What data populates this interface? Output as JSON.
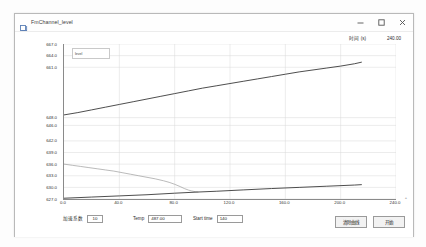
{
  "window": {
    "title": "FmChannel_level",
    "icon": "app-icon",
    "buttons": {
      "minimize": "minimize-icon",
      "maximize": "maximize-icon",
      "close": "close-icon"
    }
  },
  "header": {
    "time_label": "时间 (s)",
    "time_value": "240.00"
  },
  "controls": {
    "coef_label": "加速系数",
    "coef_value": "10",
    "temp_label": "Temp",
    "temp_value": "487.00",
    "start_time_label": "Start time",
    "start_time_value": "140",
    "clear_button": "清除曲线",
    "start_button": "开始"
  },
  "chart_data": {
    "type": "line",
    "title": "",
    "xlabel": "",
    "ylabel": "",
    "legend_text": "level",
    "legend_position": "top-left",
    "grid": true,
    "xlim": [
      0.0,
      240.0
    ],
    "ylim": [
      627.0,
      667.0
    ],
    "xticks": [
      "0.0",
      "40.0",
      "80.0",
      "120.0",
      "160.0",
      "200.0",
      "240.0"
    ],
    "xtick_values": [
      0,
      40,
      80,
      120,
      160,
      200,
      240
    ],
    "yticks": [
      "667.0",
      "664.0",
      "661.0",
      "648.0",
      "646.0",
      "642.0",
      "639.0",
      "636.0",
      "633.0",
      "630.0",
      "627.0"
    ],
    "ytick_values": [
      667.0,
      664.0,
      661.0,
      648.0,
      646.0,
      642.0,
      639.0,
      636.0,
      633.0,
      630.0,
      627.0
    ],
    "corner_mark": "+",
    "series": [
      {
        "name": "upper-level",
        "color": "#3a3a3a",
        "width": 0.9,
        "x": [
          0,
          10,
          20,
          30,
          40,
          50,
          60,
          70,
          80,
          90,
          100,
          110,
          120,
          130,
          140,
          150,
          160,
          170,
          180,
          190,
          200,
          210,
          215
        ],
        "y": [
          648.7,
          649.3,
          650.0,
          650.7,
          651.4,
          652.1,
          652.8,
          653.5,
          654.2,
          654.9,
          655.6,
          656.2,
          656.8,
          657.4,
          658.0,
          658.6,
          659.2,
          659.8,
          660.3,
          660.8,
          661.3,
          661.9,
          662.3
        ]
      },
      {
        "name": "decay-curve",
        "color": "#9c9c9c",
        "width": 0.7,
        "x": [
          0,
          6,
          12,
          18,
          24,
          30,
          36,
          42,
          48,
          54,
          60,
          66,
          72,
          76,
          80,
          84,
          87,
          90,
          92,
          94,
          95,
          96,
          96.5,
          97
        ],
        "y": [
          636.0,
          635.7,
          635.4,
          635.1,
          634.8,
          634.5,
          634.2,
          633.8,
          633.4,
          633.0,
          632.6,
          632.2,
          631.7,
          631.3,
          630.8,
          630.2,
          629.7,
          629.3,
          629.1,
          628.95,
          628.9,
          628.85,
          628.82,
          628.8
        ]
      },
      {
        "name": "lower-level",
        "color": "#3a3a3a",
        "width": 0.9,
        "x": [
          0,
          20,
          40,
          60,
          80,
          97,
          110,
          130,
          150,
          170,
          190,
          210,
          215
        ],
        "y": [
          627.2,
          627.5,
          627.8,
          628.1,
          628.5,
          628.8,
          629.0,
          629.35,
          629.7,
          630.0,
          630.3,
          630.6,
          630.7
        ]
      }
    ]
  }
}
